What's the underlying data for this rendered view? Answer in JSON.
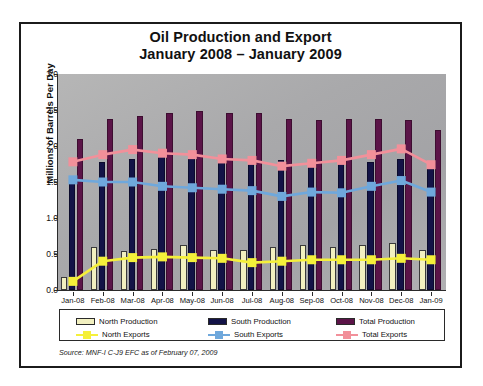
{
  "figure": {
    "title_line1": "Oil Production and Export",
    "title_line2": "January 2008 – January 2009",
    "source_note": "Source:  MNF-I C-J9 EFC as of February 07, 2009",
    "background_color": "#a8a8aa",
    "frame_color": "#1b1b1b",
    "page_color": "#ffffff"
  },
  "colors": {
    "north_production": "#f2f0c0",
    "south_production": "#131347",
    "total_production": "#5b1448",
    "north_exports": "#f5f03a",
    "south_exports": "#6fa8dc",
    "total_exports": "#f2909a"
  },
  "legend": {
    "position": "below-axis",
    "items": [
      {
        "label": "North Production",
        "type": "bar",
        "color": "#f2f0c0"
      },
      {
        "label": "South Production",
        "type": "bar",
        "color": "#131347"
      },
      {
        "label": "Total Production",
        "type": "bar",
        "color": "#5b1448"
      },
      {
        "label": "North Exports",
        "type": "line",
        "color": "#f5f03a"
      },
      {
        "label": "South Exports",
        "type": "line",
        "color": "#6fa8dc"
      },
      {
        "label": "Total Exports",
        "type": "line",
        "color": "#f2909a"
      }
    ]
  },
  "chart_data": {
    "type": "bar",
    "title": "Oil Production and Export January 2008 – January 2009",
    "xlabel": "",
    "ylabel": "Millions of Barrels Per Day",
    "ylim": [
      0.0,
      3.0
    ],
    "yticks": [
      "0.0",
      "0.5",
      "1.0",
      "1.5",
      "2.0",
      "2.5",
      "3.0"
    ],
    "ytick_values": [
      0.0,
      0.5,
      1.0,
      1.5,
      2.0,
      2.5,
      3.0
    ],
    "grid": false,
    "categories": [
      "Jan-08",
      "Feb-08",
      "Mar-08",
      "Apr-08",
      "May-08",
      "Jun-08",
      "Jul-08",
      "Aug-08",
      "Sep-08",
      "Oct-08",
      "Nov-08",
      "Dec-08",
      "Jan-09"
    ],
    "series": [
      {
        "name": "North Production",
        "kind": "bar",
        "color": "#f2f0c0",
        "values": [
          0.18,
          0.6,
          0.54,
          0.57,
          0.62,
          0.55,
          0.55,
          0.6,
          0.62,
          0.6,
          0.62,
          0.65,
          0.55
        ]
      },
      {
        "name": "South Production",
        "kind": "bar",
        "color": "#131347",
        "values": [
          1.5,
          1.78,
          1.82,
          1.86,
          1.86,
          1.86,
          1.86,
          1.8,
          1.76,
          1.8,
          1.78,
          1.82,
          1.75
        ]
      },
      {
        "name": "Total Production",
        "kind": "bar",
        "color": "#5b1448",
        "values": [
          2.1,
          2.38,
          2.42,
          2.46,
          2.48,
          2.46,
          2.46,
          2.38,
          2.36,
          2.38,
          2.38,
          2.36,
          2.22
        ]
      },
      {
        "name": "North Exports",
        "kind": "line",
        "color": "#f5f03a",
        "values": [
          0.12,
          0.4,
          0.45,
          0.46,
          0.45,
          0.44,
          0.38,
          0.4,
          0.42,
          0.42,
          0.42,
          0.44,
          0.42
        ]
      },
      {
        "name": "South Exports",
        "kind": "line",
        "color": "#6fa8dc",
        "values": [
          1.53,
          1.5,
          1.5,
          1.44,
          1.42,
          1.4,
          1.38,
          1.3,
          1.36,
          1.35,
          1.44,
          1.52,
          1.36
        ]
      },
      {
        "name": "Total Exports",
        "kind": "line",
        "color": "#f2909a",
        "values": [
          1.78,
          1.88,
          1.95,
          1.9,
          1.88,
          1.82,
          1.8,
          1.72,
          1.76,
          1.8,
          1.88,
          1.96,
          1.74
        ]
      }
    ]
  }
}
